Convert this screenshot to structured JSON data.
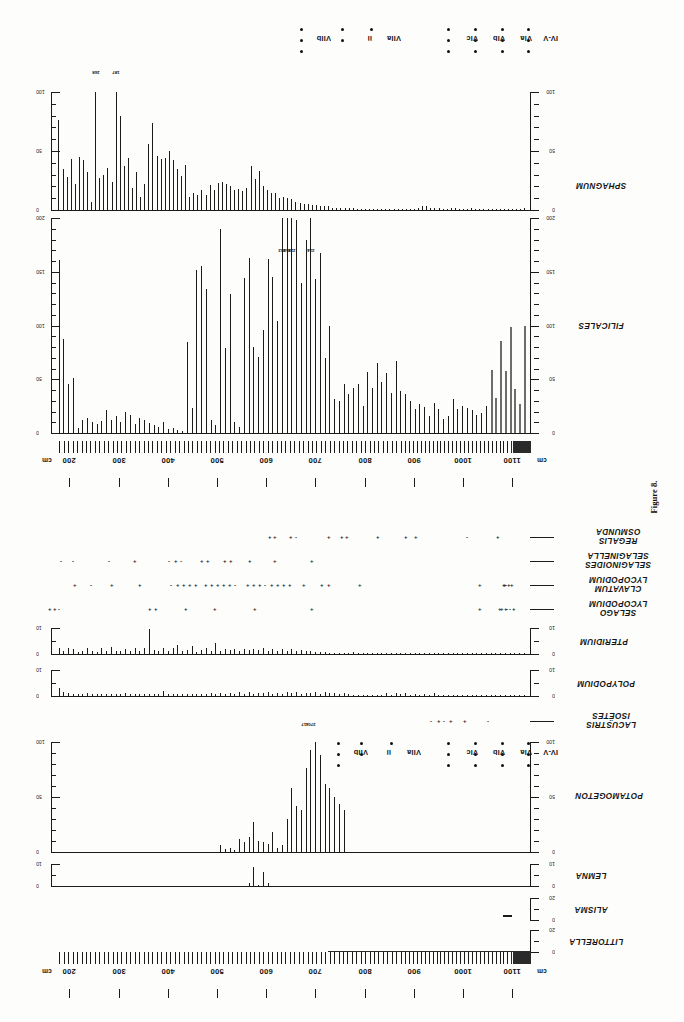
{
  "figure": {
    "caption": "Figure 8.",
    "orientation_note": "plate printed rotated 180 degrees",
    "depth_unit": "cm"
  },
  "depth_axis": {
    "unit_label_left": "cm",
    "unit_label_right": "cm",
    "ticks": [
      200,
      300,
      400,
      500,
      600,
      700,
      800,
      900,
      1000,
      1100
    ],
    "min": 175,
    "max": 1140
  },
  "zones": {
    "labels": [
      "VIIb",
      "ii",
      "VIIa",
      "i",
      "VIc",
      "VIb",
      "VIa",
      "IV-V"
    ],
    "upper_row": [
      {
        "label": "VIIb",
        "x": 300,
        "dots": 3
      },
      {
        "label": "ii",
        "x": 341,
        "dots": 2
      },
      {
        "label": "VIIa",
        "x": 370,
        "dots": 1
      },
      {
        "label": "VIc",
        "x": 447,
        "dots": 3
      },
      {
        "label": "VIb",
        "x": 474,
        "dots": 3
      },
      {
        "label": "VIa",
        "x": 501,
        "dots": 3
      },
      {
        "label": "IV-V",
        "x": 527,
        "dots": 3
      }
    ],
    "lower_row": [
      {
        "label": "VIIb",
        "x": 337,
        "dots": 3
      },
      {
        "label": "ii",
        "x": 360,
        "dots": 2
      },
      {
        "label": "VIIa",
        "x": 390,
        "dots": 1
      },
      {
        "label": "VIc",
        "x": 447,
        "dots": 3
      },
      {
        "label": "VIb",
        "x": 474,
        "dots": 3
      },
      {
        "label": "VIa",
        "x": 501,
        "dots": 3
      },
      {
        "label": "IV-V",
        "x": 527,
        "dots": 3
      }
    ]
  },
  "chart_data": [
    {
      "type": "bar",
      "name": "SPHAGNUM",
      "title": "SPHAGNUM",
      "xlabel": "Depth (cm)",
      "ylabel": "Count",
      "ylim": [
        0,
        100
      ],
      "yticks": [
        0,
        50,
        100
      ],
      "ytick_labels": [
        "0",
        "50",
        "100"
      ],
      "minor_tick_step": 10,
      "annotations": [
        {
          "label": "268",
          "index": 9
        },
        {
          "label": "187",
          "index": 14
        }
      ],
      "values": [
        76,
        35,
        28,
        43,
        22,
        45,
        42,
        32,
        7,
        268,
        27,
        30,
        36,
        24,
        187,
        80,
        37,
        44,
        19,
        32,
        11,
        22,
        56,
        74,
        46,
        43,
        44,
        50,
        42,
        35,
        29,
        38,
        11,
        14,
        13,
        17,
        13,
        21,
        17,
        23,
        24,
        22,
        20,
        17,
        18,
        16,
        19,
        37,
        26,
        33,
        20,
        17,
        14,
        14,
        10,
        11,
        10,
        9,
        7,
        6,
        5,
        5,
        4,
        4,
        3,
        3,
        3,
        2,
        2,
        2,
        2,
        2,
        2,
        1,
        1,
        1,
        1,
        1,
        1,
        1,
        1,
        1,
        1,
        1,
        1,
        1,
        1,
        1,
        2,
        3,
        3,
        2,
        2,
        2,
        1,
        1,
        2,
        2,
        1,
        1,
        1,
        2,
        1,
        1,
        1,
        1,
        1,
        1,
        1,
        1,
        1,
        1,
        1,
        1,
        2
      ]
    },
    {
      "type": "bar",
      "name": "FILICALES",
      "title": "FILICALES",
      "xlabel": "Depth (cm)",
      "ylabel": "Count",
      "ylim": [
        0,
        200
      ],
      "yticks": [
        0,
        50,
        100,
        150,
        200
      ],
      "ytick_labels": [
        "0",
        "50",
        "100",
        "150",
        "200"
      ],
      "minor_tick_step": 10,
      "annotations": [
        {
          "label": "262",
          "index": 47
        },
        {
          "label": "258",
          "index": 48
        },
        {
          "label": "228",
          "index": 49
        },
        {
          "label": "234",
          "index": 53
        }
      ],
      "values": [
        161,
        87,
        46,
        51,
        5,
        12,
        14,
        10,
        8,
        11,
        21,
        12,
        16,
        10,
        20,
        17,
        8,
        14,
        12,
        9,
        7,
        6,
        10,
        4,
        5,
        3,
        2,
        85,
        23,
        152,
        155,
        134,
        12,
        7,
        190,
        79,
        129,
        10,
        6,
        144,
        163,
        80,
        71,
        96,
        162,
        145,
        104,
        262,
        258,
        228,
        198,
        140,
        180,
        234,
        143,
        167,
        70,
        100,
        32,
        30,
        46,
        36,
        42,
        46,
        25,
        57,
        42,
        65,
        47,
        56,
        37,
        67,
        39,
        36,
        30,
        22,
        27,
        24,
        16,
        28,
        22,
        13,
        16,
        32,
        22,
        25,
        23,
        21,
        17,
        19,
        25,
        59,
        33,
        86,
        58,
        99,
        41,
        27,
        100
      ]
    },
    {
      "type": "bar",
      "name": "PTERIDIUM",
      "title": "PTERIDIUM",
      "ylim": [
        0,
        10
      ],
      "yticks": [
        0,
        10
      ],
      "ytick_labels": [
        "0",
        "10"
      ],
      "values": [
        2.3,
        1.0,
        2.2,
        2.0,
        0.6,
        1.0,
        2.5,
        1.0,
        0.9,
        2.4,
        1.0,
        2.6,
        1.3,
        1.2,
        2.1,
        1.3,
        2.3,
        1.0,
        2.5,
        9.6,
        1.6,
        1.1,
        2.5,
        1.0,
        2.2,
        3.5,
        1.0,
        1.6,
        3.2,
        0.8,
        1.4,
        2.5,
        1.0,
        4.3,
        1.2,
        1.8,
        1.5,
        1.9,
        1.3,
        2.0,
        1.4,
        2.1,
        1.5,
        2.3,
        1.2,
        1.9,
        1.3,
        2.0,
        1.2,
        1.8,
        1.0,
        1.6,
        1.1,
        1.0,
        0.8,
        0.7,
        0.6,
        0.5,
        0.4,
        0.4,
        0.3,
        0.3,
        0.8,
        0.2,
        0.3,
        0.3,
        0.2,
        0.2,
        0.2,
        0.3,
        0.4,
        0.2,
        0.2,
        0.2,
        0.2,
        0.5,
        0.2,
        0.2,
        0.2,
        0.3,
        0.2,
        0.2,
        0.5,
        0.3,
        0.3,
        0.4,
        0.3,
        0.3,
        0.2,
        0.2,
        0.2,
        0.2,
        0.2,
        0.2,
        0.2,
        0.2,
        0.2,
        0.2,
        0.2
      ]
    },
    {
      "type": "bar",
      "name": "POLYPODIUM",
      "title": "POLYPODIUM",
      "ylim": [
        0,
        10
      ],
      "yticks": [
        0,
        10
      ],
      "ytick_labels": [
        "0",
        "10"
      ],
      "values": [
        3.2,
        1.4,
        1.2,
        0.8,
        0.6,
        0.8,
        1.0,
        0.8,
        0.6,
        0.8,
        0.7,
        0.9,
        0.6,
        0.7,
        1.0,
        0.6,
        0.8,
        0.7,
        0.6,
        0.7,
        0.8,
        0.6,
        1.8,
        0.6,
        0.7,
        0.8,
        0.6,
        0.9,
        0.7,
        0.6,
        0.9,
        0.8,
        1.0,
        0.7,
        1.2,
        0.8,
        1.3,
        0.9,
        1.4,
        0.8,
        1.6,
        0.9,
        1.3,
        1.0,
        1.6,
        0.9,
        1.2,
        0.9,
        1.4,
        1.0,
        1.5,
        0.9,
        1.3,
        1.0,
        1.4,
        0.9,
        1.5,
        1.0,
        1.3,
        0.8,
        1.0,
        0.6,
        0.5,
        0.4,
        0.4,
        0.3,
        0.3,
        0.3,
        0.4,
        1.1,
        0.5,
        1.0,
        0.6,
        1.3,
        0.5,
        0.9,
        0.4,
        0.6,
        0.4,
        1.0,
        0.5,
        0.4,
        0.4,
        0.3,
        0.3,
        0.3,
        0.3,
        0.3,
        0.3,
        0.3,
        0.3,
        0.3,
        0.3,
        0.3,
        0.3,
        0.3,
        0.3,
        0.3,
        0.3
      ]
    },
    {
      "type": "bar",
      "name": "POTAMOGETON",
      "title": "POTAMOGETON",
      "ylim": [
        0,
        100
      ],
      "yticks": [
        0,
        50,
        100
      ],
      "ytick_labels": [
        "0",
        "50",
        "100"
      ],
      "minor_tick_step": 10,
      "values": [
        0,
        0,
        0,
        0,
        0,
        0,
        0,
        0,
        0,
        0,
        0,
        0,
        0,
        0,
        0,
        0,
        0,
        0,
        0,
        0,
        0,
        0,
        0,
        0,
        0,
        0,
        0,
        0,
        0,
        0,
        0,
        0,
        0,
        0,
        6,
        3,
        4,
        2,
        12,
        9,
        14,
        27,
        10,
        9,
        7,
        18,
        4,
        6,
        30,
        58,
        42,
        38,
        76,
        93,
        110,
        88,
        62,
        58,
        50,
        44,
        38,
        0,
        0,
        0,
        0,
        0,
        0,
        0,
        0,
        0,
        0,
        0,
        0,
        0,
        0,
        0,
        0,
        0,
        0,
        0,
        0,
        0,
        0,
        0,
        0,
        0,
        0,
        0,
        0,
        0,
        0,
        0,
        0,
        0,
        0,
        0,
        0,
        0,
        0
      ]
    },
    {
      "type": "bar",
      "name": "LEMNA",
      "title": "LEMNA",
      "ylim": [
        0,
        10
      ],
      "yticks": [
        0,
        10
      ],
      "ytick_labels": [
        "0",
        "10"
      ],
      "values": [
        0,
        0,
        0,
        0,
        0,
        0,
        0,
        0,
        0,
        0,
        0,
        0,
        0,
        0,
        0,
        0,
        0,
        0,
        0,
        0,
        0,
        0,
        0,
        0,
        0,
        0,
        0,
        0,
        0,
        0,
        0,
        0,
        0,
        0,
        0,
        0,
        0,
        0,
        0,
        0,
        1.5,
        8.8,
        0.6,
        6.5,
        1.2,
        0,
        0,
        0,
        0,
        0,
        0,
        0,
        0,
        0,
        0,
        0,
        0,
        0,
        0,
        0,
        0,
        0,
        0,
        0,
        0,
        0,
        0,
        0,
        0,
        0,
        0,
        0,
        0,
        0,
        0,
        0,
        0,
        0,
        0,
        0,
        0,
        0,
        0,
        0,
        0,
        0,
        0,
        0,
        0,
        0,
        0,
        0,
        0,
        0,
        0,
        0,
        0,
        0,
        0
      ]
    },
    {
      "type": "bar",
      "name": "ALISMA",
      "title": "ALISMA",
      "ylim": [
        0,
        20
      ],
      "yticks": [
        0,
        20
      ],
      "ytick_labels": [
        "0",
        "20"
      ],
      "values": []
    },
    {
      "type": "bar",
      "name": "LITTORELLA",
      "title": "LITTORELLA",
      "ylim": [
        0,
        20
      ],
      "yticks": [
        0,
        20
      ],
      "ytick_labels": [
        "0",
        "20"
      ],
      "values": []
    }
  ],
  "presence_rows": [
    {
      "taxon_line1": "OSMUNDA",
      "taxon_line2": "REGALIS",
      "marks": [
        {
          "x": 268,
          "sym": "+"
        },
        {
          "x": 273,
          "sym": "+"
        },
        {
          "x": 289,
          "sym": "+"
        },
        {
          "x": 295,
          "sym": "-"
        },
        {
          "x": 327,
          "sym": "+"
        },
        {
          "x": 340,
          "sym": "+"
        },
        {
          "x": 345,
          "sym": "+"
        },
        {
          "x": 376,
          "sym": "+"
        },
        {
          "x": 404,
          "sym": "+"
        },
        {
          "x": 414,
          "sym": "+"
        },
        {
          "x": 466,
          "sym": "-"
        },
        {
          "x": 496,
          "sym": "+"
        }
      ]
    },
    {
      "taxon_line1": "SELAGINELLA",
      "taxon_line2": "SELAGINOIDES",
      "marks": [
        {
          "x": 60,
          "sym": "-"
        },
        {
          "x": 72,
          "sym": "-"
        },
        {
          "x": 108,
          "sym": "-"
        },
        {
          "x": 133,
          "sym": "+"
        },
        {
          "x": 168,
          "sym": "-"
        },
        {
          "x": 174,
          "sym": "+"
        },
        {
          "x": 180,
          "sym": "-"
        },
        {
          "x": 200,
          "sym": "+"
        },
        {
          "x": 206,
          "sym": "+"
        },
        {
          "x": 223,
          "sym": "+"
        },
        {
          "x": 229,
          "sym": "+"
        },
        {
          "x": 248,
          "sym": "+"
        },
        {
          "x": 273,
          "sym": "+"
        },
        {
          "x": 310,
          "sym": "+"
        }
      ]
    },
    {
      "taxon_line1": "LYCOPODIUM",
      "taxon_line2": "CLAVATUM",
      "marks": [
        {
          "x": 73,
          "sym": "+"
        },
        {
          "x": 90,
          "sym": "-"
        },
        {
          "x": 110,
          "sym": "+"
        },
        {
          "x": 138,
          "sym": "+"
        },
        {
          "x": 170,
          "sym": "-"
        },
        {
          "x": 176,
          "sym": "+"
        },
        {
          "x": 182,
          "sym": "+"
        },
        {
          "x": 188,
          "sym": "+"
        },
        {
          "x": 194,
          "sym": "+"
        },
        {
          "x": 204,
          "sym": "+"
        },
        {
          "x": 210,
          "sym": "+"
        },
        {
          "x": 216,
          "sym": "+"
        },
        {
          "x": 222,
          "sym": "+"
        },
        {
          "x": 228,
          "sym": "+"
        },
        {
          "x": 234,
          "sym": "-"
        },
        {
          "x": 246,
          "sym": "+"
        },
        {
          "x": 252,
          "sym": "+"
        },
        {
          "x": 258,
          "sym": "+"
        },
        {
          "x": 264,
          "sym": "-"
        },
        {
          "x": 270,
          "sym": "+"
        },
        {
          "x": 276,
          "sym": "+"
        },
        {
          "x": 282,
          "sym": "+"
        },
        {
          "x": 288,
          "sym": "+"
        },
        {
          "x": 302,
          "sym": "+"
        },
        {
          "x": 320,
          "sym": "+"
        },
        {
          "x": 327,
          "sym": "+"
        },
        {
          "x": 358,
          "sym": "+"
        },
        {
          "x": 478,
          "sym": "+"
        },
        {
          "x": 502,
          "sym": "+"
        },
        {
          "x": 507,
          "sym": "+"
        },
        {
          "x": 505,
          "sym": "-"
        },
        {
          "x": 510,
          "sym": "+"
        },
        {
          "x": 503,
          "sym": "+"
        }
      ]
    },
    {
      "taxon_line1": "LYCOPODIUM",
      "taxon_line2": "SELAGO",
      "marks": [
        {
          "x": 48,
          "sym": "+"
        },
        {
          "x": 53,
          "sym": "+"
        },
        {
          "x": 58,
          "sym": "-"
        },
        {
          "x": 148,
          "sym": "+"
        },
        {
          "x": 154,
          "sym": "+"
        },
        {
          "x": 184,
          "sym": "+"
        },
        {
          "x": 213,
          "sym": "+"
        },
        {
          "x": 253,
          "sym": "+"
        },
        {
          "x": 310,
          "sym": "+"
        },
        {
          "x": 478,
          "sym": "+"
        },
        {
          "x": 500,
          "sym": "+"
        },
        {
          "x": 506,
          "sym": "-"
        },
        {
          "x": 512,
          "sym": "+"
        },
        {
          "x": 504,
          "sym": "+"
        },
        {
          "x": 509,
          "sym": "-"
        },
        {
          "x": 498,
          "sym": "+"
        }
      ]
    },
    {
      "taxon_line1": "ISOËTES",
      "taxon_line2": "LACUSTRIS",
      "marks": [
        {
          "x": 430,
          "sym": "-"
        },
        {
          "x": 437,
          "sym": "+"
        },
        {
          "x": 443,
          "sym": "-"
        },
        {
          "x": 449,
          "sym": "+"
        },
        {
          "x": 463,
          "sym": "+"
        },
        {
          "x": 487,
          "sym": "-"
        }
      ]
    }
  ],
  "isoetes_annotations": [
    {
      "label": "417",
      "x": 304
    },
    {
      "label": "270",
      "x": 311
    }
  ]
}
